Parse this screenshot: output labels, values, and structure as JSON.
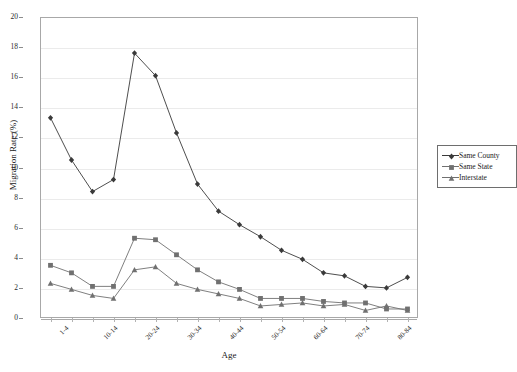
{
  "chart_data": {
    "type": "line",
    "title": "",
    "xlabel": "Age",
    "ylabel": "Migration Rate (%)",
    "ylim": [
      0,
      20
    ],
    "ytick_step": 2,
    "yticks": [
      "0",
      "2",
      "4",
      "6",
      "8",
      "10",
      "12",
      "14",
      "16",
      "18",
      "20"
    ],
    "grid": "horizontal",
    "legend_position": "right",
    "categories": [
      "1-4",
      "5-9",
      "10-14",
      "15-19",
      "20-24",
      "25-29",
      "30-34",
      "35-39",
      "40-44",
      "45-49",
      "50-54",
      "55-59",
      "60-64",
      "65-69",
      "70-74",
      "75-79",
      "80-84",
      "85+"
    ],
    "visible_tick_labels": [
      "1-4",
      "",
      "10-14",
      "",
      "20-24",
      "",
      "30-34",
      "",
      "40-44",
      "",
      "50-54",
      "",
      "60-64",
      "",
      "70-74",
      "",
      "80-84",
      ""
    ],
    "series": [
      {
        "name": "Same County",
        "marker": "diamond",
        "color": "#3a3a3a",
        "values": [
          13.3,
          10.5,
          8.4,
          9.2,
          17.6,
          16.1,
          12.3,
          8.9,
          7.1,
          6.2,
          5.4,
          4.5,
          3.9,
          3.0,
          2.8,
          2.1,
          2.0,
          2.7
        ]
      },
      {
        "name": "Same State",
        "marker": "square",
        "color": "#707070",
        "values": [
          3.5,
          3.0,
          2.1,
          2.1,
          5.3,
          5.2,
          4.2,
          3.2,
          2.4,
          1.9,
          1.3,
          1.3,
          1.3,
          1.1,
          1.0,
          1.0,
          0.6,
          0.6
        ]
      },
      {
        "name": "Interstate",
        "marker": "triangle",
        "color": "#707070",
        "values": [
          2.3,
          1.9,
          1.5,
          1.3,
          3.2,
          3.4,
          2.3,
          1.9,
          1.6,
          1.3,
          0.8,
          0.9,
          1.0,
          0.8,
          0.9,
          0.5,
          0.8,
          0.5
        ]
      }
    ]
  },
  "legend": {
    "items": [
      {
        "label": "Same County"
      },
      {
        "label": "Same State"
      },
      {
        "label": "Interstate"
      }
    ]
  }
}
